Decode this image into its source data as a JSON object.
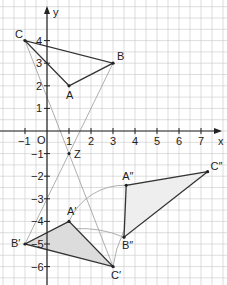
{
  "diagram": {
    "type": "coordinate-geometry",
    "axes": {
      "x_label": "x",
      "y_label": "y",
      "origin_label": "O",
      "x_ticks": [
        "-1",
        "1",
        "2",
        "3",
        "4",
        "5",
        "6",
        "7"
      ],
      "y_ticks": [
        "4",
        "3",
        "2",
        "1",
        "-1",
        "-2",
        "-3",
        "-4",
        "-5",
        "-6"
      ]
    },
    "points": {
      "A": {
        "label": "A",
        "x": 1,
        "y": 2
      },
      "B": {
        "label": "B",
        "x": 3,
        "y": 3
      },
      "C": {
        "label": "C",
        "x": -1,
        "y": 4
      },
      "Z": {
        "label": "Z",
        "x": 1,
        "y": -1
      },
      "A1": {
        "label": "A′",
        "x": 1,
        "y": -4
      },
      "B1": {
        "label": "B′",
        "x": -1,
        "y": -5
      },
      "C1": {
        "label": "C′",
        "x": 3,
        "y": -6
      },
      "A2": {
        "label": "A″",
        "x": 3.6,
        "y": -2.4
      },
      "B2": {
        "label": "B″",
        "x": 3.5,
        "y": -4.7
      },
      "C2": {
        "label": "C″",
        "x": 7.3,
        "y": -1.8
      }
    },
    "colors": {
      "grid": "#c8c8c8",
      "axis": "#222222",
      "triangle_stroke": "#333333",
      "fill": "#dcdcdc",
      "fill_light": "#eeeeee",
      "construction": "#9a9a9a"
    }
  }
}
